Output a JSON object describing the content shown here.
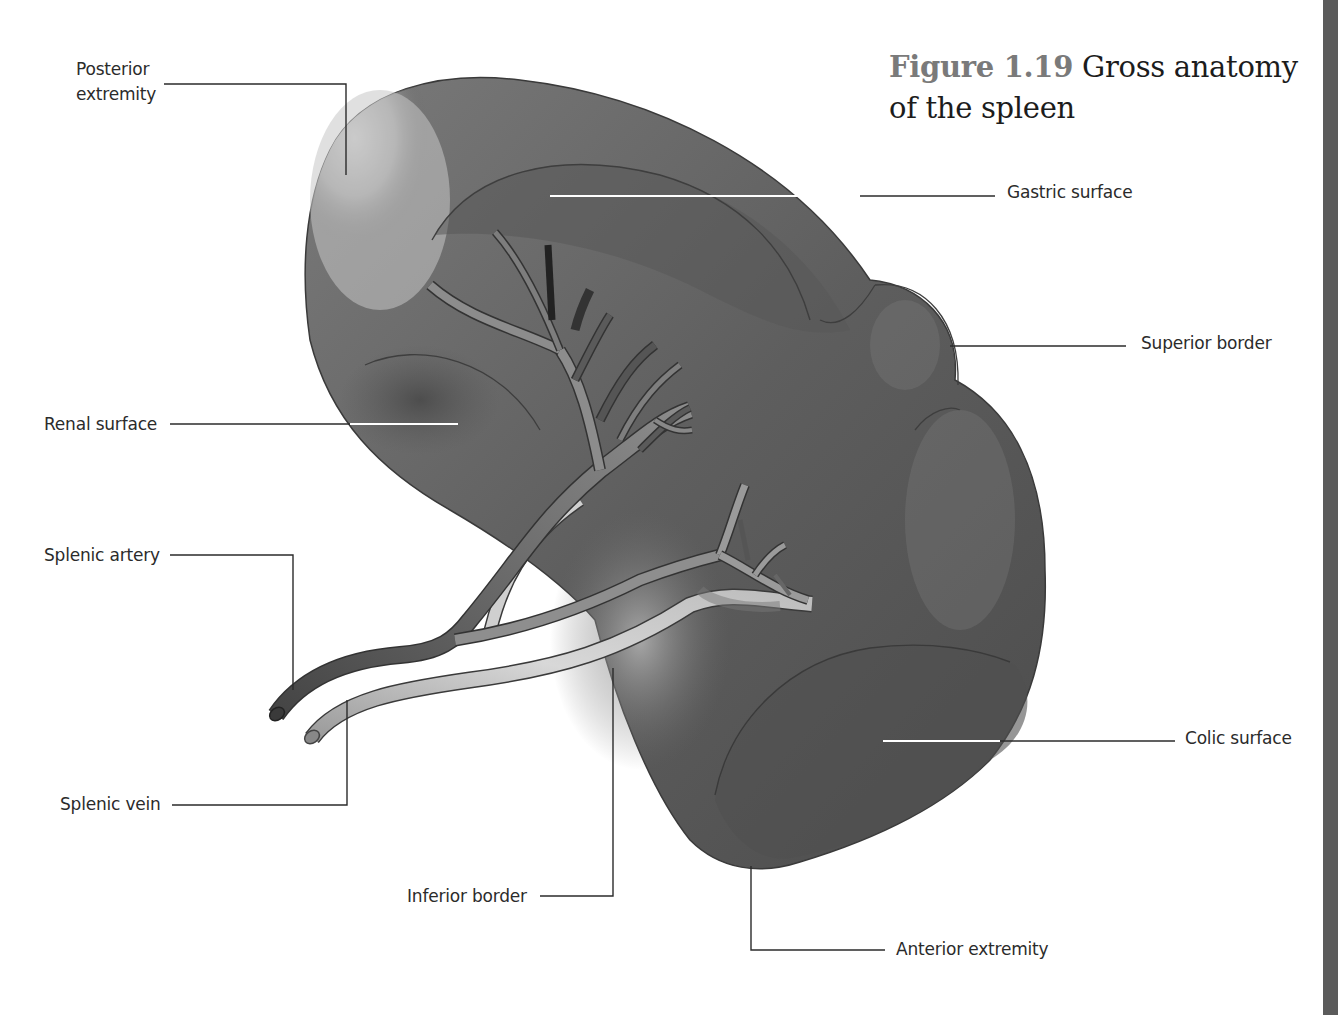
{
  "figure": {
    "number": "Figure 1.19",
    "title": "Gross anatomy of the spleen",
    "title_line1": "Gross anatomy",
    "title_line2": "of the spleen"
  },
  "labels": {
    "posterior_extremity_line1": "Posterior",
    "posterior_extremity_line2": "extremity",
    "gastric_surface": "Gastric surface",
    "superior_border": "Superior border",
    "renal_surface": "Renal surface",
    "splenic_artery": "Splenic artery",
    "splenic_vein": "Splenic vein",
    "colic_surface": "Colic surface",
    "inferior_border": "Inferior border",
    "anterior_extremity": "Anterior extremity"
  },
  "colors": {
    "organ_dark": "#4a4a4a",
    "organ_mid": "#6e6e6e",
    "organ_light": "#c9c9c9",
    "artery": "#4d4d4d",
    "vein": "#a8a8a8",
    "leader_line": "#2b2b2b",
    "figure_number": "#7a7a7a",
    "side_bar": "#5b5b5b"
  }
}
